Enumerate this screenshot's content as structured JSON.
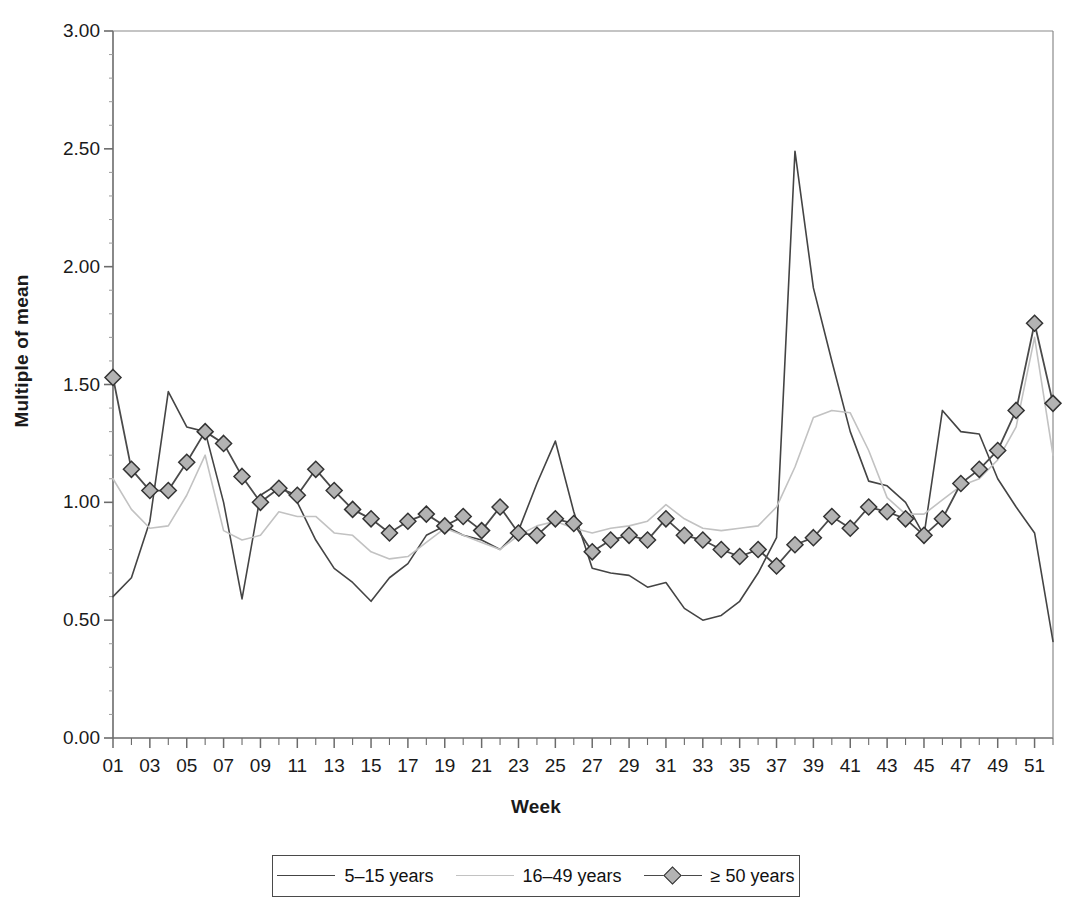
{
  "chart_data": {
    "type": "line",
    "title": "",
    "xlabel": "Week",
    "ylabel": "Multiple of mean",
    "xlim": [
      1,
      52
    ],
    "ylim": [
      0.0,
      3.0
    ],
    "grid": false,
    "legend_position": "bottom",
    "y_ticks": [
      "0.00",
      "0.50",
      "1.00",
      "1.50",
      "2.00",
      "2.50",
      "3.00"
    ],
    "y_tick_values": [
      0.0,
      0.5,
      1.0,
      1.5,
      2.0,
      2.5,
      3.0
    ],
    "x_tick_labels": [
      "01",
      "03",
      "05",
      "07",
      "09",
      "11",
      "13",
      "15",
      "17",
      "19",
      "21",
      "23",
      "25",
      "27",
      "29",
      "31",
      "33",
      "35",
      "37",
      "39",
      "41",
      "43",
      "45",
      "47",
      "49",
      "51"
    ],
    "x_tick_values": [
      1,
      3,
      5,
      7,
      9,
      11,
      13,
      15,
      17,
      19,
      21,
      23,
      25,
      27,
      29,
      31,
      33,
      35,
      37,
      39,
      41,
      43,
      45,
      47,
      49,
      51
    ],
    "x": [
      1,
      2,
      3,
      4,
      5,
      6,
      7,
      8,
      9,
      10,
      11,
      12,
      13,
      14,
      15,
      16,
      17,
      18,
      19,
      20,
      21,
      22,
      23,
      24,
      25,
      26,
      27,
      28,
      29,
      30,
      31,
      32,
      33,
      34,
      35,
      36,
      37,
      38,
      39,
      40,
      41,
      42,
      43,
      44,
      45,
      46,
      47,
      48,
      49,
      50,
      51,
      52
    ],
    "series": [
      {
        "name": "5–15 years",
        "color": "#444444",
        "marker": "none",
        "values": [
          0.6,
          0.68,
          0.92,
          1.47,
          1.32,
          1.3,
          1.0,
          0.59,
          1.03,
          1.08,
          1.0,
          0.84,
          0.72,
          0.66,
          0.58,
          0.68,
          0.74,
          0.86,
          0.9,
          0.86,
          0.84,
          0.8,
          0.88,
          1.08,
          1.26,
          0.96,
          0.72,
          0.7,
          0.69,
          0.64,
          0.66,
          0.55,
          0.5,
          0.52,
          0.58,
          0.7,
          0.85,
          2.49,
          1.91,
          1.6,
          1.3,
          1.09,
          1.07,
          1.0,
          0.86,
          1.39,
          1.3,
          1.29,
          1.1,
          0.98,
          0.87,
          0.41
        ]
      },
      {
        "name": "16–49 years",
        "color": "#c2c2c2",
        "marker": "none",
        "values": [
          1.1,
          0.97,
          0.89,
          0.9,
          1.03,
          1.2,
          0.88,
          0.84,
          0.86,
          0.96,
          0.94,
          0.94,
          0.87,
          0.86,
          0.79,
          0.76,
          0.77,
          0.83,
          0.89,
          0.86,
          0.83,
          0.8,
          0.86,
          0.9,
          0.92,
          0.89,
          0.87,
          0.89,
          0.9,
          0.92,
          0.99,
          0.93,
          0.89,
          0.88,
          0.89,
          0.9,
          0.98,
          1.15,
          1.36,
          1.39,
          1.38,
          1.22,
          1.02,
          0.95,
          0.95,
          1.01,
          1.07,
          1.1,
          1.18,
          1.32,
          1.7,
          1.2
        ]
      },
      {
        "name": "≥ 50 years",
        "color": "#4a4a4a",
        "marker": "diamond",
        "marker_fill": "#b3b3b3",
        "values": [
          1.53,
          1.14,
          1.05,
          1.05,
          1.17,
          1.3,
          1.25,
          1.11,
          1.0,
          1.06,
          1.03,
          1.14,
          1.05,
          0.97,
          0.93,
          0.87,
          0.92,
          0.95,
          0.9,
          0.94,
          0.88,
          0.98,
          0.87,
          0.86,
          0.93,
          0.91,
          0.79,
          0.84,
          0.86,
          0.84,
          0.93,
          0.86,
          0.84,
          0.8,
          0.77,
          0.8,
          0.73,
          0.82,
          0.85,
          0.94,
          0.89,
          0.98,
          0.96,
          0.93,
          0.86,
          0.93,
          1.08,
          1.14,
          1.22,
          1.39,
          1.76,
          1.42
        ]
      }
    ]
  },
  "legend": {
    "entries": [
      {
        "label": "5–15 years",
        "type": "line",
        "color": "#444444"
      },
      {
        "label": "16–49 years",
        "type": "line",
        "color": "#c2c2c2"
      },
      {
        "label": "≥ 50 years",
        "type": "line-marker",
        "color": "#4a4a4a"
      }
    ]
  },
  "axes": {
    "x_title": "Week",
    "y_title": "Multiple of mean"
  }
}
